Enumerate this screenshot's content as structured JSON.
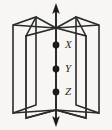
{
  "figure": {
    "kind": "geometry-diagram",
    "background_color": "#f7f6f2",
    "stroke_color": "#2b2b2b",
    "point_fill_color": "#1a1a1a",
    "axis": {
      "name": "common-line",
      "orientation": "vertical",
      "arrow_top": true,
      "arrow_bottom": true,
      "x": 56,
      "y_top": 4,
      "y_bottom": 126
    },
    "points": [
      {
        "label": "X",
        "x": 56,
        "y": 45,
        "label_x": 66,
        "label_y": 40
      },
      {
        "label": "Y",
        "x": 56,
        "y": 69,
        "label_x": 66,
        "label_y": 64
      },
      {
        "label": "Z",
        "x": 56,
        "y": 92,
        "label_x": 66,
        "label_y": 87
      }
    ],
    "half_planes": [
      {
        "name": "outer-left-page",
        "side": "left"
      },
      {
        "name": "inner-left-page",
        "side": "left"
      },
      {
        "name": "inner-right-page",
        "side": "right"
      },
      {
        "name": "outer-right-page",
        "side": "right"
      }
    ]
  }
}
